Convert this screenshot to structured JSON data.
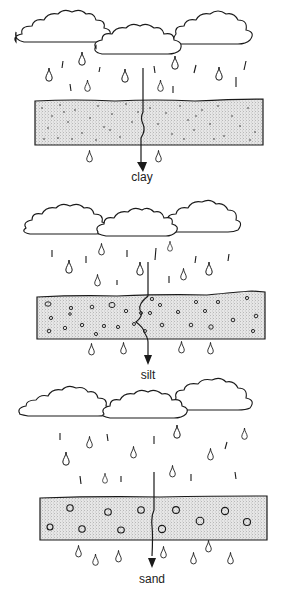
{
  "diagram": {
    "title": "",
    "panels": [
      {
        "id": "clay",
        "label": "clay",
        "particle_size": "very fine dots",
        "color_band": "#e4e4e4"
      },
      {
        "id": "silt",
        "label": "silt",
        "particle_size": "small circles",
        "color_band": "#e4e4e4"
      },
      {
        "id": "sand",
        "label": "sand",
        "particle_size": "large circles",
        "color_band": "#e4e4e4"
      }
    ]
  },
  "colors": {
    "line": "#1a1a1a",
    "band_fill": "#e2e2e2",
    "background": "#ffffff"
  }
}
